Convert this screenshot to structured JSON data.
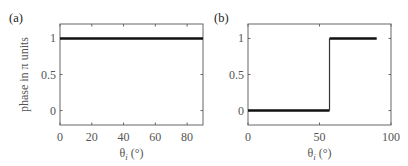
{
  "chart_data": [
    {
      "type": "line",
      "panel_label": "(a)",
      "xlabel": "θ_i (°)",
      "xlabel_main": "θ",
      "xlabel_sub": "i",
      "xlabel_rest": " (°)",
      "ylabel": "phase in π units",
      "xlim": [
        0,
        90
      ],
      "ylim": [
        -0.2,
        1.2
      ],
      "xticks": [
        0,
        20,
        40,
        60,
        80
      ],
      "xtick_labels": [
        "0",
        "20",
        "40",
        "60",
        "80"
      ],
      "yticks": [
        0,
        0.5,
        1
      ],
      "ytick_labels": [
        "0",
        "0.5",
        "1"
      ],
      "grid": false,
      "series": [
        {
          "name": "phase",
          "x": [
            0,
            90
          ],
          "y": [
            1,
            1
          ]
        }
      ]
    },
    {
      "type": "line",
      "panel_label": "(b)",
      "xlabel": "θ_i (°)",
      "xlabel_main": "θ",
      "xlabel_sub": "i",
      "xlabel_rest": " (°)",
      "ylabel": "",
      "xlim": [
        0,
        100
      ],
      "ylim": [
        -0.2,
        1.2
      ],
      "xticks": [
        0,
        50,
        100
      ],
      "xtick_labels": [
        "0",
        "50",
        "100"
      ],
      "yticks": [
        0,
        0.5,
        1
      ],
      "ytick_labels": [
        "0",
        "0.5",
        "1"
      ],
      "grid": false,
      "series": [
        {
          "name": "phase",
          "x": [
            0,
            57,
            57,
            90
          ],
          "y": [
            0,
            0,
            1,
            1
          ]
        }
      ]
    }
  ]
}
